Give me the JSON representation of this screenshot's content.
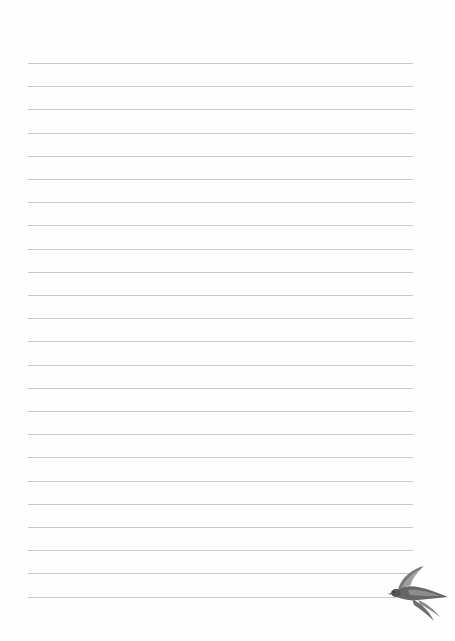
{
  "paper": {
    "type": "lined-writing-paper",
    "background": "#fefefe",
    "rule_color": "#c9c9c9",
    "rule_count": 24,
    "first_rule_y": 63,
    "rule_spacing": 23.2,
    "rule_left": 28,
    "rule_width": 385
  },
  "decoration": {
    "icon": "swallow-bird-icon",
    "position": "bottom-right",
    "colors": [
      "#5a5a5a",
      "#7d7d7d",
      "#9a9a9a"
    ]
  }
}
